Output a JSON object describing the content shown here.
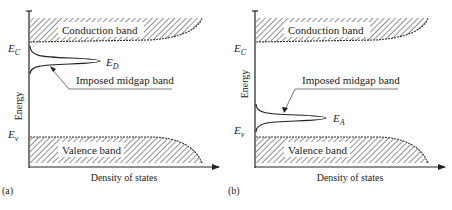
{
  "figure": {
    "panels": [
      {
        "id": "a",
        "panel_label": "(a)",
        "conduction_band_label": "Conduction band",
        "valence_band_label": "Valence band",
        "y_axis_label": "Energy",
        "x_axis_label": "Density of states",
        "ec_label": "E",
        "ec_sub": "C",
        "ev_label": "E",
        "ev_sub": "v",
        "level_label": "E",
        "level_sub": "D",
        "annotation": "Imposed midgap band",
        "level_position": "near conduction band"
      },
      {
        "id": "b",
        "panel_label": "(b)",
        "conduction_band_label": "Conduction band",
        "valence_band_label": "Valence band",
        "y_axis_label": "Energy",
        "x_axis_label": "Density of states",
        "ec_label": "E",
        "ec_sub": "C",
        "ev_label": "E",
        "ev_sub": "v",
        "level_label": "E",
        "level_sub": "A",
        "annotation": "Imposed midgap band",
        "level_position": "near valence band"
      }
    ],
    "colors": {
      "ink": "#222222",
      "background": "#ffffff"
    }
  }
}
